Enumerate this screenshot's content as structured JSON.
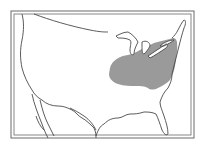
{
  "map": {
    "region": "United States (contiguous)",
    "shaded_region_label": "",
    "colors": {
      "background": "#ffffff",
      "outline": "#4a4a4a",
      "shaded": "#9a9a9a",
      "frame": "#6a6a6a"
    }
  }
}
